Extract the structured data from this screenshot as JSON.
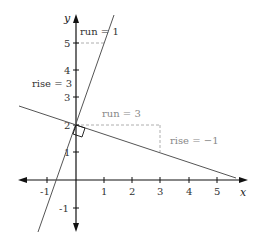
{
  "diagram": {
    "axes": {
      "x_label": "x",
      "y_label": "y",
      "x_ticks": [
        "-1",
        "1",
        "2",
        "3",
        "4",
        "5"
      ],
      "y_ticks": [
        "-1",
        "1",
        "2",
        "3",
        "4",
        "5"
      ]
    },
    "lines": [
      {
        "name": "steep-line",
        "slope": 3,
        "intercept": 2,
        "run_label": "run = 1",
        "rise_label": "rise = 3"
      },
      {
        "name": "shallow-line",
        "slope": -0.3333,
        "intercept": 2,
        "run_label": "run = 3",
        "rise_label": "rise = −1"
      }
    ],
    "annotations": {
      "run_steep": "run = 1",
      "rise_steep": "rise = 3",
      "run_shallow": "run = 3",
      "rise_shallow": "rise = −1"
    },
    "colors": {
      "axis": "#111111",
      "line": "#555555",
      "dashed": "#999999",
      "label": "#333333",
      "label_gray": "#888888"
    }
  }
}
